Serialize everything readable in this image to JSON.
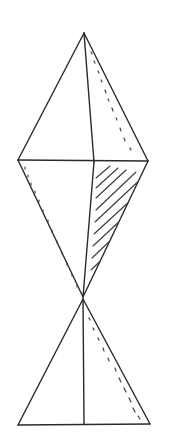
{
  "figure": {
    "stroke_color": "#2a2a2a",
    "background": "#ffffff",
    "vertices": {
      "top_apex": [
        84,
        33
      ],
      "left": [
        18,
        160
      ],
      "right": [
        148,
        161
      ],
      "mid_inner": [
        94,
        162
      ],
      "waist": [
        83,
        297
      ],
      "lower_apex": [
        83,
        299
      ],
      "base_left": [
        18,
        425
      ],
      "base_mid": [
        84,
        424
      ],
      "base_right": [
        150,
        424
      ]
    },
    "shading": {
      "hatched_region": "upper-right triangle of lower kite half (between inner line, horizontal, right edge)",
      "dotted_edges": [
        "upper-right edge of top triangle",
        "lower-left edge of kite",
        "right edge of bottom triangle"
      ]
    }
  }
}
